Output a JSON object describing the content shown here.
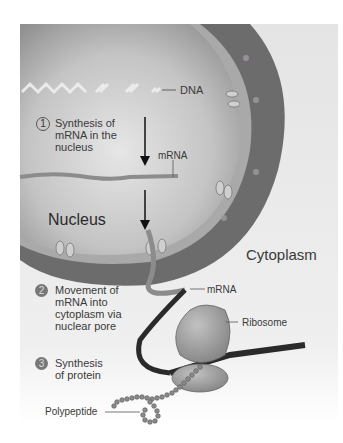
{
  "labels": {
    "dna": "DNA",
    "mrna_nucleus": "mRNA",
    "nucleus": "Nucleus",
    "cytoplasm": "Cytoplasm",
    "mrna_cytoplasm": "mRNA",
    "ribosome": "Ribosome",
    "polypeptide": "Polypeptide"
  },
  "steps": [
    {
      "number": "1",
      "lines": [
        "Synthesis of",
        "mRNA in the",
        "nucleus"
      ]
    },
    {
      "number": "2",
      "lines": [
        "Movement of",
        "mRNA into",
        "cytoplasm via",
        "nuclear pore"
      ]
    },
    {
      "number": "3",
      "lines": [
        "Synthesis",
        "of protein"
      ]
    }
  ],
  "colors": {
    "nucleus_light": "#d8d8d8",
    "nucleus_dark": "#9a9a9a",
    "membrane": "#a8a8a8",
    "er_band": "#6a6a6a",
    "cytoplasm": "#ececec",
    "ribosome": "#9c9c9c",
    "mrna_dark": "#2a2a2a"
  }
}
